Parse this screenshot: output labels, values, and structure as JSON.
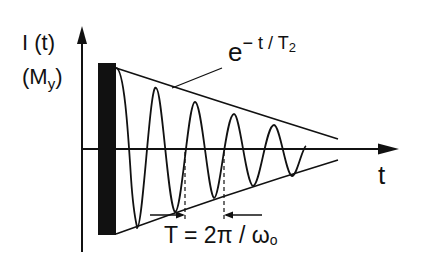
{
  "diagram": {
    "y_axis_label": "I (t)",
    "y_axis_sublabel_main": "(M",
    "y_axis_sublabel_sub": "y",
    "y_axis_sublabel_end": ")",
    "x_axis_label": "t",
    "envelope_label_base": "e",
    "envelope_label_exp": "− t / T",
    "envelope_label_exp_sub": "2",
    "period_label_main": "T = 2π / ω",
    "period_label_sub": "o",
    "colors": {
      "ink": "#111111",
      "background": "#ffffff"
    },
    "elements": [
      "y-axis-arrow",
      "time-axis-arrow",
      "rf-pulse-bar",
      "decaying-oscillation",
      "upper-envelope",
      "lower-envelope",
      "period-marker"
    ]
  }
}
